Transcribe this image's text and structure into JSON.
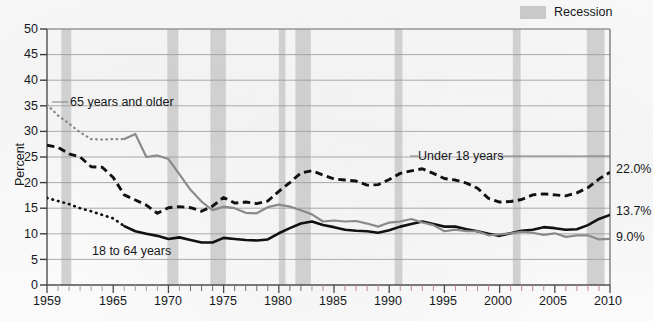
{
  "chart_data": {
    "type": "line",
    "title": "",
    "subtitle": "",
    "xlabel": "",
    "ylabel": "Percent",
    "xlim": [
      1959,
      2010
    ],
    "ylim": [
      0,
      50
    ],
    "ytick_step": 5,
    "grid": true,
    "legend_position": "top-right",
    "x": [
      1959,
      1960,
      1961,
      1962,
      1963,
      1964,
      1965,
      1966,
      1967,
      1968,
      1969,
      1970,
      1971,
      1972,
      1973,
      1974,
      1975,
      1976,
      1977,
      1978,
      1979,
      1980,
      1981,
      1982,
      1983,
      1984,
      1985,
      1986,
      1987,
      1988,
      1989,
      1990,
      1991,
      1992,
      1993,
      1994,
      1995,
      1996,
      1997,
      1998,
      1999,
      2000,
      2001,
      2002,
      2003,
      2004,
      2005,
      2006,
      2007,
      2008,
      2009,
      2010
    ],
    "yticks": [
      0,
      5,
      10,
      15,
      20,
      25,
      30,
      35,
      40,
      45,
      50
    ],
    "xticks_major": [
      1959,
      1965,
      1970,
      1975,
      1980,
      1985,
      1990,
      1995,
      2000,
      2005,
      2010
    ],
    "series": [
      {
        "name": "Under 18 years",
        "style": "dashed",
        "color": "#111111",
        "end_label": "22.0%",
        "label_text": "Under 18 years",
        "values": [
          27.3,
          26.9,
          25.6,
          25.0,
          23.1,
          23.0,
          21.0,
          17.6,
          16.6,
          15.6,
          14.0,
          15.1,
          15.3,
          15.1,
          14.4,
          15.4,
          17.1,
          16.0,
          16.2,
          15.9,
          16.4,
          18.3,
          20.0,
          21.9,
          22.3,
          21.5,
          20.7,
          20.5,
          20.3,
          19.5,
          19.6,
          20.6,
          21.8,
          22.3,
          22.7,
          21.8,
          20.8,
          20.5,
          19.9,
          18.9,
          16.9,
          16.2,
          16.3,
          16.7,
          17.6,
          17.8,
          17.6,
          17.4,
          18.0,
          19.0,
          20.7,
          22.0
        ]
      },
      {
        "name": "18 to 64 years",
        "style": "solid",
        "color": "#111111",
        "end_label": "13.7%",
        "label_text": "18 to 64 years",
        "values": [
          17.0,
          16.4,
          15.8,
          15.0,
          14.4,
          13.7,
          13.0,
          11.5,
          10.5,
          10.0,
          9.6,
          9.0,
          9.3,
          8.8,
          8.3,
          8.3,
          9.2,
          9.0,
          8.8,
          8.7,
          8.9,
          10.1,
          11.1,
          12.0,
          12.4,
          11.7,
          11.3,
          10.8,
          10.6,
          10.5,
          10.2,
          10.7,
          11.4,
          11.9,
          12.4,
          11.9,
          11.4,
          11.4,
          10.9,
          10.5,
          10.0,
          9.6,
          10.1,
          10.6,
          10.8,
          11.3,
          11.1,
          10.8,
          10.9,
          11.7,
          12.9,
          13.7
        ],
        "note": "Early years (1959-1965) drawn dotted as estimated"
      },
      {
        "name": "65 years and older",
        "style": "solid",
        "color": "#8a8a8a",
        "end_label": "9.0%",
        "label_text": "65 years and older",
        "dotted_until": 1966,
        "values": [
          35.2,
          33.1,
          31.5,
          29.8,
          28.5,
          28.4,
          28.5,
          28.5,
          29.5,
          25.0,
          25.3,
          24.6,
          21.6,
          18.6,
          16.3,
          14.6,
          15.3,
          15.0,
          14.1,
          14.0,
          15.2,
          15.7,
          15.3,
          14.6,
          13.8,
          12.4,
          12.6,
          12.4,
          12.5,
          12.0,
          11.4,
          12.2,
          12.4,
          12.9,
          12.2,
          11.7,
          10.5,
          10.8,
          10.5,
          10.5,
          9.7,
          9.9,
          10.1,
          10.4,
          10.2,
          9.8,
          10.1,
          9.4,
          9.7,
          9.7,
          8.9,
          9.0
        ]
      }
    ],
    "recession_bands": [
      {
        "start": 1960.3,
        "end": 1961.2
      },
      {
        "start": 1969.9,
        "end": 1970.9
      },
      {
        "start": 1973.8,
        "end": 1975.2
      },
      {
        "start": 1980.0,
        "end": 1980.6
      },
      {
        "start": 1981.5,
        "end": 1982.9
      },
      {
        "start": 1990.5,
        "end": 1991.2
      },
      {
        "start": 2001.2,
        "end": 2001.9
      },
      {
        "start": 2007.9,
        "end": 2009.5
      }
    ],
    "annotations": [
      {
        "text": "65 years and older",
        "x": 1961.5,
        "y": 35.0
      },
      {
        "text": "Under 18 years",
        "x": 1993.0,
        "y": 25.6
      },
      {
        "text": "18 to 64 years",
        "x": 1965.5,
        "y": 6.4
      }
    ]
  },
  "legend": {
    "items": [
      {
        "label": "Recession",
        "color": "#c9c9c9",
        "swatch": "band-swatch"
      }
    ]
  },
  "axis": {
    "y_title": "Percent",
    "y_labels": [
      "50",
      "45",
      "40",
      "35",
      "30",
      "25",
      "20",
      "15",
      "10",
      "5",
      "0"
    ],
    "x_labels": [
      "1959",
      "1965",
      "1970",
      "1975",
      "1980",
      "1985",
      "1990",
      "1995",
      "2000",
      "2005",
      "2010"
    ]
  },
  "end_labels": {
    "under18": "22.0%",
    "adults": "13.7%",
    "seniors": "9.0%"
  },
  "series_labels": {
    "seniors": "65 years and older",
    "under18": "Under 18 years",
    "adults": "18 to 64 years"
  },
  "colors": {
    "recession_band": "#c9c9c9",
    "gridline": "#9a9a9a",
    "axis": "#555555",
    "series_dark": "#111111",
    "series_gray": "#8a8a8a",
    "tick_green": "#8fae8f",
    "tick_red": "#b98b8b"
  }
}
